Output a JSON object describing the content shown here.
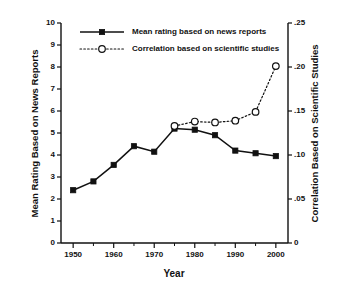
{
  "figure": {
    "cut_off_header": "",
    "background": "#ffffff",
    "ink_color": "#111111"
  },
  "chart_data": {
    "type": "line",
    "title": "",
    "xlabel": "Year",
    "ylabel": "Mean Rating Based on News Reports",
    "y2label": "Correlation Based on Scientific Studies",
    "x": [
      1950,
      1955,
      1960,
      1965,
      1970,
      1975,
      1980,
      1985,
      1990,
      1995,
      2000
    ],
    "xlim": [
      1947,
      2003
    ],
    "xticks_major": [
      1950,
      1960,
      1970,
      1980,
      1990,
      2000
    ],
    "xticks_major_labels": [
      "1950",
      "1960",
      "1970",
      "1980",
      "1990",
      "2000"
    ],
    "xticks_minor": [
      1955,
      1965,
      1975,
      1985,
      1995
    ],
    "ylim": [
      0,
      10
    ],
    "yticks": [
      0,
      1,
      2,
      3,
      4,
      5,
      6,
      7,
      8,
      9,
      10
    ],
    "ytick_labels": [
      "0",
      "1",
      "2",
      "3",
      "4",
      "5",
      "6",
      "7",
      "8",
      "9",
      "10"
    ],
    "y2lim": [
      0,
      0.25
    ],
    "y2ticks": [
      0,
      0.05,
      0.1,
      0.15,
      0.2,
      0.25
    ],
    "y2tick_labels": [
      "0",
      ".05",
      ".10",
      ".15",
      ".20",
      ".25"
    ],
    "grid": false,
    "legend_position": "upper left",
    "series": [
      {
        "name": "Mean rating based on news reports",
        "axis": "left",
        "marker": "filled-square",
        "linestyle": "solid",
        "color": "#111111",
        "x": [
          1950,
          1955,
          1960,
          1965,
          1970,
          1975,
          1980,
          1985,
          1990,
          1995,
          2000
        ],
        "values": [
          2.4,
          2.8,
          3.55,
          4.4,
          4.15,
          5.2,
          5.15,
          4.9,
          4.2,
          4.08,
          3.95
        ]
      },
      {
        "name": "Correlation based on scientific studies",
        "axis": "right",
        "marker": "open-circle",
        "linestyle": "dotted",
        "color": "#111111",
        "x": [
          1975,
          1980,
          1985,
          1990,
          1995,
          2000
        ],
        "values": [
          0.133,
          0.138,
          0.137,
          0.139,
          0.149,
          0.201
        ]
      }
    ]
  },
  "legend": {
    "items": [
      {
        "label": "Mean rating based on news reports",
        "marker": "filled-square",
        "linestyle": "solid"
      },
      {
        "label": "Correlation based on scientific studies",
        "marker": "open-circle",
        "linestyle": "dotted"
      }
    ]
  }
}
